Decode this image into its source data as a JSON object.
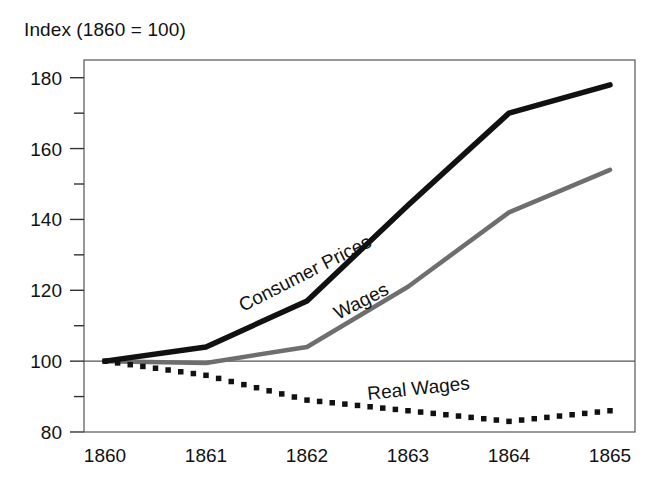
{
  "chart_data": {
    "type": "line",
    "title": "Index (1860 = 100)",
    "xlabel": "",
    "ylabel": "",
    "xlim": [
      1860,
      1865
    ],
    "ylim": [
      80,
      185
    ],
    "grid": false,
    "legend_position": "inline-annotations",
    "x": [
      1860,
      1861,
      1862,
      1863,
      1864,
      1865
    ],
    "categories": [
      "1860",
      "1861",
      "1862",
      "1863",
      "1864",
      "1865"
    ],
    "ytick_labels": [
      "80",
      "100",
      "120",
      "140",
      "160",
      "180"
    ],
    "ytick_values": [
      80,
      100,
      120,
      140,
      160,
      180
    ],
    "yminor_tick_values": [
      90,
      110,
      130,
      150,
      170
    ],
    "reference_line": 100,
    "series": [
      {
        "name": "Consumer Prices",
        "values": [
          100,
          104,
          117,
          144,
          170,
          178
        ],
        "style": "solid",
        "color": "#111111",
        "width": 5.5
      },
      {
        "name": "Wages",
        "values": [
          100,
          99.5,
          104,
          121,
          142,
          154
        ],
        "style": "solid",
        "color": "#6e6e6e",
        "width": 4.5
      },
      {
        "name": "Real Wages",
        "values": [
          100,
          96,
          89,
          86,
          83,
          86
        ],
        "style": "dotted-squares",
        "color": "#111111",
        "width": 4.5
      }
    ],
    "annotations": [
      {
        "text": "Consumer Prices",
        "series": "Consumer Prices",
        "rotation": -27
      },
      {
        "text": "Wages",
        "series": "Wages",
        "rotation": -27
      },
      {
        "text": "Real Wages",
        "series": "Real Wages",
        "rotation": -6
      }
    ]
  },
  "axes": {
    "frame_color": "#555555",
    "tick_color": "#333333"
  }
}
